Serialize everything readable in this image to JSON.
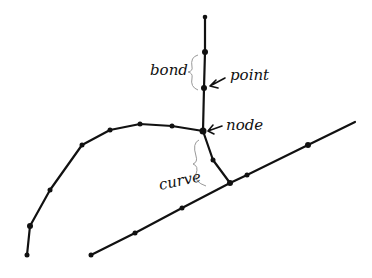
{
  "labels": {
    "bond": "bond",
    "point": "point",
    "node": "node",
    "curve": "curve"
  },
  "colors": {
    "ink": "#111111",
    "brace": "#999999",
    "background": "#ffffff"
  }
}
